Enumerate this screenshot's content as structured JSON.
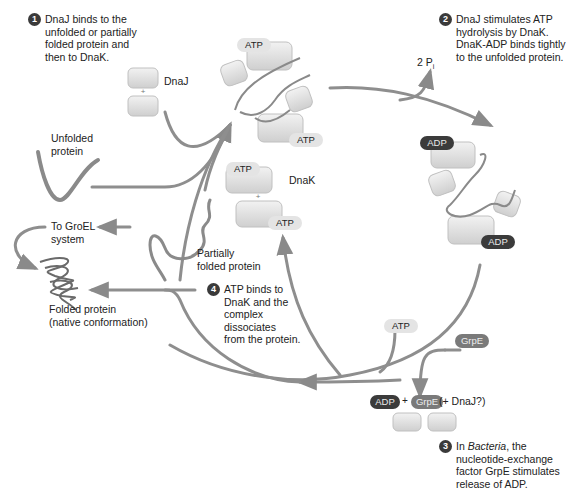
{
  "diagram": {
    "colors": {
      "arrow": "#8a8a8a",
      "protein_block": "#dcdcdc",
      "atp_pill": "#e4e4e4",
      "adp_pill": "#3b3b3b",
      "grpe_pill": "#7a7a7a",
      "step_badge": "#3a3a3a"
    },
    "steps": [
      {
        "number": "1",
        "lines": [
          "DnaJ binds to the",
          "unfolded or partially",
          "folded protein and",
          "then to DnaK."
        ]
      },
      {
        "number": "2",
        "lines": [
          "DnaJ stimulates ATP",
          "hydrolysis by DnaK.",
          "DnaK-ADP binds tightly",
          "to the unfolded protein."
        ]
      },
      {
        "number": "3",
        "lines_prefix": "In ",
        "italic_word": "Bacteria",
        "lines_suffix": ", the",
        "lines": [
          "nucleotide-exchange",
          "factor GrpE stimulates",
          "release of ADP."
        ]
      },
      {
        "number": "4",
        "lines": [
          "ATP binds to",
          "DnaK and the",
          "complex",
          "dissociates",
          "from the protein."
        ]
      }
    ],
    "labels": {
      "dnaj": "DnaJ",
      "dnak": "DnaK",
      "plus": "+",
      "unfolded_protein": [
        "Unfolded",
        "protein"
      ],
      "partially_folded": [
        "Partially",
        "folded protein"
      ],
      "to_groel": [
        "To GroEL",
        "system"
      ],
      "folded_protein": [
        "Folded protein",
        "(native conformation)"
      ],
      "phosphate": "2 P",
      "phosphate_sub": "i",
      "release_eq": {
        "adp": "ADP",
        "plus": "+",
        "grpe": "GrpE",
        "dnaj": "(+ DnaJ?)"
      }
    },
    "nucleotides": {
      "atp": "ATP",
      "adp": "ADP",
      "grpe": "GrpE"
    }
  }
}
